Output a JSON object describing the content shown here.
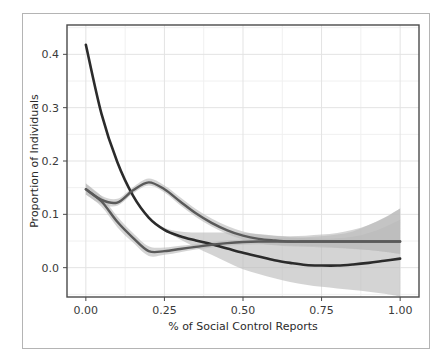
{
  "chart_data": {
    "type": "line",
    "title": "",
    "xlabel": "% of Social Control Reports",
    "ylabel": "Proportion of Individuals",
    "xlim": [
      -0.06,
      1.06
    ],
    "ylim": [
      -0.055,
      0.455
    ],
    "xticks": [
      0.0,
      0.25,
      0.5,
      0.75,
      1.0
    ],
    "xticklabels": [
      "0.00",
      "0.25",
      "0.50",
      "0.75",
      "1.00"
    ],
    "yticks": [
      0.0,
      0.1,
      0.2,
      0.3,
      0.4
    ],
    "yticklabels": [
      "0.0",
      "0.1",
      "0.2",
      "0.3",
      "0.4"
    ],
    "grid": true,
    "grid_minor": true,
    "legend": "none",
    "x": [
      0.0,
      0.05,
      0.1,
      0.15,
      0.2,
      0.25,
      0.3,
      0.35,
      0.4,
      0.45,
      0.5,
      0.55,
      0.6,
      0.65,
      0.7,
      0.75,
      0.8,
      0.85,
      0.9,
      0.95,
      1.0
    ],
    "series": [
      {
        "name": "series-steep-decline",
        "color": "#2b2b2b",
        "values": [
          0.418,
          0.288,
          0.198,
          0.135,
          0.094,
          0.071,
          0.059,
          0.051,
          0.044,
          0.036,
          0.028,
          0.021,
          0.014,
          0.009,
          0.005,
          0.004,
          0.004,
          0.006,
          0.009,
          0.013,
          0.017
        ],
        "band_lower": [
          0.418,
          0.288,
          0.198,
          0.135,
          0.094,
          0.069,
          0.053,
          0.038,
          0.024,
          0.01,
          -0.003,
          -0.012,
          -0.02,
          -0.027,
          -0.032,
          -0.036,
          -0.039,
          -0.042,
          -0.045,
          -0.049,
          -0.054
        ],
        "band_upper": [
          0.418,
          0.288,
          0.198,
          0.135,
          0.094,
          0.075,
          0.068,
          0.066,
          0.066,
          0.066,
          0.065,
          0.063,
          0.06,
          0.057,
          0.055,
          0.054,
          0.055,
          0.058,
          0.065,
          0.076,
          0.09
        ]
      },
      {
        "name": "series-bimodal",
        "color": "#5a5a5a",
        "values": [
          0.147,
          0.127,
          0.122,
          0.145,
          0.16,
          0.147,
          0.124,
          0.102,
          0.084,
          0.07,
          0.06,
          0.054,
          0.051,
          0.049,
          0.049,
          0.049,
          0.049,
          0.049,
          0.049,
          0.049,
          0.049
        ],
        "band_lower": [
          0.137,
          0.119,
          0.116,
          0.139,
          0.154,
          0.141,
          0.117,
          0.095,
          0.077,
          0.063,
          0.053,
          0.046,
          0.042,
          0.04,
          0.039,
          0.038,
          0.037,
          0.035,
          0.033,
          0.03,
          0.026
        ],
        "band_upper": [
          0.158,
          0.135,
          0.129,
          0.151,
          0.167,
          0.154,
          0.132,
          0.11,
          0.092,
          0.078,
          0.068,
          0.062,
          0.06,
          0.059,
          0.06,
          0.062,
          0.065,
          0.071,
          0.08,
          0.093,
          0.111
        ]
      },
      {
        "name": "series-bimodal-lower-lobe",
        "color": "#5a5a5a",
        "values": [
          0.147,
          0.124,
          0.086,
          0.056,
          0.031,
          0.031,
          0.035,
          0.039,
          0.043,
          0.046,
          0.048,
          0.049,
          0.049,
          0.049,
          0.049,
          0.049,
          0.049,
          0.049,
          0.049,
          0.049,
          0.049
        ],
        "band_lower": [
          0.137,
          0.114,
          0.076,
          0.047,
          0.022,
          0.024,
          0.029,
          0.034,
          0.038,
          0.041,
          0.043,
          0.044,
          0.043,
          0.042,
          0.041,
          0.04,
          0.038,
          0.036,
          0.033,
          0.03,
          0.026
        ],
        "band_upper": [
          0.158,
          0.134,
          0.096,
          0.065,
          0.04,
          0.038,
          0.041,
          0.044,
          0.048,
          0.051,
          0.053,
          0.054,
          0.055,
          0.056,
          0.057,
          0.059,
          0.062,
          0.068,
          0.08,
          0.094,
          0.111
        ]
      }
    ],
    "colors": {
      "line_dark": "#2b2b2b",
      "line_mid": "#5a5a5a",
      "band_fill": "#b9b9b9",
      "grid_major": "#e3e3e3",
      "grid_minor": "#f0f0f0",
      "plot_border": "#4a4a4a",
      "figure_border": "#b4b4b4",
      "background": "#ffffff",
      "tick_text": "#3a3a3a"
    }
  }
}
